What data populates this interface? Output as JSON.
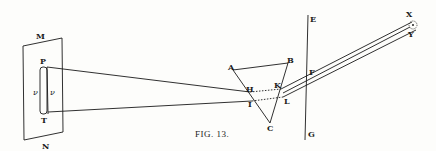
{
  "figure": {
    "caption": "Fig. 13.",
    "caption_display": "FIG. 13."
  },
  "labels": {
    "M": "M",
    "N": "N",
    "P": "P",
    "T": "T",
    "nu_left": "ν",
    "nu_right": "ν",
    "A": "A",
    "B": "B",
    "C": "C",
    "H": "H",
    "I": "I",
    "K": "K",
    "L": "L",
    "E": "E",
    "F": "F",
    "G": "G",
    "X": "X",
    "Y": "Y"
  },
  "colors": {
    "ink": "#1a1a1a",
    "paper": "#fdfdfb"
  }
}
